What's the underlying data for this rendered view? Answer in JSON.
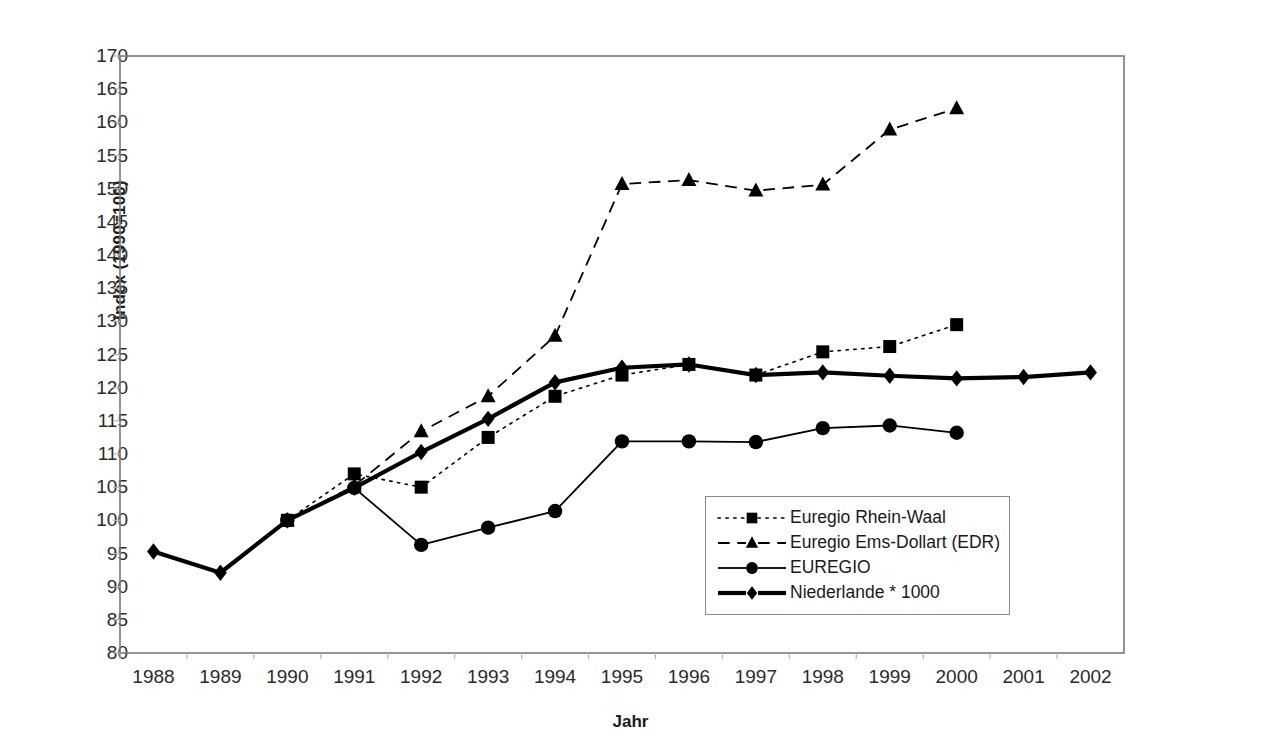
{
  "chart_data": {
    "type": "line",
    "title": "",
    "xlabel": "Jahr",
    "ylabel": "Index (1990=100)",
    "categories": [
      "1988",
      "1989",
      "1990",
      "1991",
      "1992",
      "1993",
      "1994",
      "1995",
      "1996",
      "1997",
      "1998",
      "1999",
      "2000",
      "2001",
      "2002"
    ],
    "ylim": [
      80,
      170
    ],
    "ytick_step": 5,
    "yticks": [
      "170",
      "165",
      "160",
      "155",
      "150",
      "145",
      "140",
      "135",
      "130",
      "125",
      "120",
      "115",
      "110",
      "105",
      "100",
      "95",
      "90",
      "85",
      "80"
    ],
    "grid": false,
    "legend_position": "inside-lower-right",
    "series": [
      {
        "name": "Euregio Rhein-Waal",
        "marker": "square",
        "line_style": "dotted",
        "line_width": 1.6,
        "color": "#000000",
        "values": [
          null,
          null,
          100.0,
          107.0,
          105.0,
          112.5,
          118.7,
          121.9,
          123.5,
          121.9,
          125.4,
          126.2,
          129.5,
          null,
          null
        ]
      },
      {
        "name": "Euregio Ems-Dollart (EDR)",
        "marker": "triangle",
        "line_style": "dashed",
        "line_width": 1.8,
        "color": "#000000",
        "values": [
          null,
          null,
          100.0,
          105.2,
          113.4,
          118.7,
          127.8,
          150.7,
          151.3,
          149.7,
          150.6,
          158.9,
          162.1,
          null,
          null
        ]
      },
      {
        "name": "EUREGIO",
        "marker": "circle",
        "line_style": "solid",
        "line_width": 1.8,
        "color": "#000000",
        "values": [
          null,
          null,
          100.0,
          104.9,
          96.3,
          98.9,
          101.4,
          111.9,
          111.9,
          111.8,
          113.9,
          114.3,
          113.2,
          null,
          null
        ]
      },
      {
        "name": "Niederlande * 1000",
        "marker": "diamond",
        "line_style": "solid",
        "line_width": 4.2,
        "color": "#000000",
        "values": [
          95.3,
          92.1,
          100.0,
          104.9,
          110.3,
          115.3,
          120.8,
          123.0,
          123.5,
          121.9,
          122.3,
          121.8,
          121.4,
          121.6,
          122.3
        ]
      }
    ]
  },
  "axis": {
    "frame_color": "#7a7a7a",
    "tick_color": "#b5b5b5"
  },
  "legend": {
    "items": [
      {
        "label": "Euregio Rhein-Waal",
        "key": "dotted-square-key"
      },
      {
        "label": "Euregio Ems-Dollart (EDR)",
        "key": "dashed-triangle-key"
      },
      {
        "label": "EUREGIO",
        "key": "solid-circle-key"
      },
      {
        "label": "Niederlande * 1000",
        "key": "bold-diamond-key"
      }
    ]
  }
}
